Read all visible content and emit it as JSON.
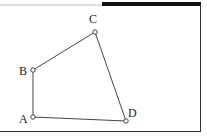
{
  "diagram": {
    "type": "quadrilateral",
    "colors": {
      "line": "#444444",
      "frame": "#333333",
      "frame_top_thick": "#111111",
      "frame_top_thin": "#bbbbbb",
      "background": "#ffffff"
    },
    "vertices": [
      {
        "label": "A",
        "x": 33,
        "y": 117
      },
      {
        "label": "B",
        "x": 33,
        "y": 70
      },
      {
        "label": "C",
        "x": 95,
        "y": 32
      },
      {
        "label": "D",
        "x": 126,
        "y": 121
      }
    ],
    "edges": [
      [
        "A",
        "B"
      ],
      [
        "B",
        "C"
      ],
      [
        "C",
        "D"
      ],
      [
        "D",
        "A"
      ]
    ],
    "labels": {
      "A": "A",
      "B": "B",
      "C": "C",
      "D": "D"
    }
  }
}
